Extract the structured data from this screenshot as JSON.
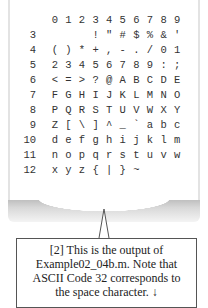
{
  "ascii_table": {
    "column_headers": [
      "0",
      "1",
      "2",
      "3",
      "4",
      "5",
      "6",
      "7",
      "8",
      "9"
    ],
    "rows": [
      {
        "label": "3",
        "cells": [
          "",
          "",
          " ",
          "!",
          "\"",
          "#",
          "$",
          "%",
          "&",
          "'"
        ]
      },
      {
        "label": "4",
        "cells": [
          "(",
          ")",
          "*",
          "+",
          ",",
          "-",
          ".",
          "/",
          "0",
          "1"
        ]
      },
      {
        "label": "5",
        "cells": [
          "2",
          "3",
          "4",
          "5",
          "6",
          "7",
          "8",
          "9",
          ":",
          ";"
        ]
      },
      {
        "label": "6",
        "cells": [
          "<",
          "=",
          ">",
          "?",
          "@",
          "A",
          "B",
          "C",
          "D",
          "E"
        ]
      },
      {
        "label": "7",
        "cells": [
          "F",
          "G",
          "H",
          "I",
          "J",
          "K",
          "L",
          "M",
          "N",
          "O"
        ]
      },
      {
        "label": "8",
        "cells": [
          "P",
          "Q",
          "R",
          "S",
          "T",
          "U",
          "V",
          "W",
          "X",
          "Y"
        ]
      },
      {
        "label": "9",
        "cells": [
          "Z",
          "[",
          "\\",
          "]",
          "^",
          "_",
          "`",
          "a",
          "b",
          "c"
        ]
      },
      {
        "label": "10",
        "cells": [
          "d",
          "e",
          "f",
          "g",
          "h",
          "i",
          "j",
          "k",
          "l",
          "m"
        ]
      },
      {
        "label": "11",
        "cells": [
          "n",
          "o",
          "p",
          "q",
          "r",
          "s",
          "t",
          "u",
          "v",
          "w"
        ]
      },
      {
        "label": "12",
        "cells": [
          "x",
          "y",
          "z",
          "{",
          "|",
          "}",
          "~",
          "",
          "",
          ""
        ]
      }
    ]
  },
  "callout": {
    "lines": [
      "[2] This is the output of",
      "Example02_04b.m.  Note that",
      "ASCII Code 32 corresponds to",
      "the space character.  ↓"
    ]
  }
}
